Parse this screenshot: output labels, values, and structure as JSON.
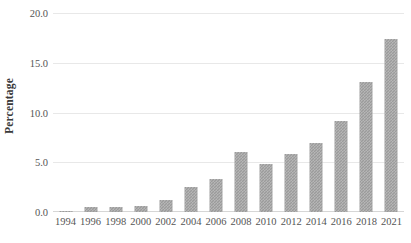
{
  "chart_data": {
    "type": "bar",
    "title": "",
    "subtitle": "",
    "xlabel": "",
    "ylabel": "Percentage",
    "categories": [
      "1994",
      "1996",
      "1998",
      "2000",
      "2002",
      "2004",
      "2006",
      "2008",
      "2010",
      "2012",
      "2014",
      "2016",
      "2018",
      "2021"
    ],
    "values": [
      0.1,
      0.5,
      0.5,
      0.6,
      1.2,
      2.5,
      3.3,
      6.0,
      4.8,
      5.8,
      6.9,
      9.1,
      13.1,
      17.4
    ],
    "series": [
      {
        "name": "Percentage",
        "values": [
          0.1,
          0.5,
          0.5,
          0.6,
          1.2,
          2.5,
          3.3,
          6.0,
          4.8,
          5.8,
          6.9,
          9.1,
          13.1,
          17.4
        ]
      }
    ],
    "ylim": [
      0.0,
      20.0
    ],
    "ytick_labels": [
      "0.0",
      "5.0",
      "10.0",
      "15.0",
      "20.0"
    ],
    "ytick_values": [
      0.0,
      5.0,
      10.0,
      15.0,
      20.0
    ],
    "grid": true,
    "grid_axis": "y",
    "legend": false,
    "legend_position": "none",
    "bar_color": "#9b9b9b",
    "grid_color": "#e8e8e8",
    "text_color": "#555555",
    "background_color": "#ffffff",
    "annotations": []
  }
}
